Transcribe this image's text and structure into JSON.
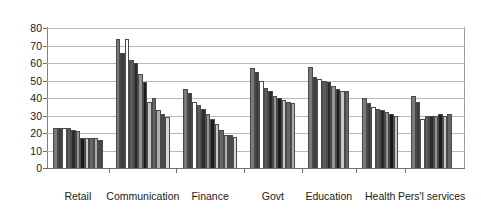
{
  "chart_data": {
    "type": "bar",
    "title": "",
    "subtitle": "",
    "xlabel": "",
    "ylabel": "",
    "ylim": [
      0,
      80
    ],
    "ytick_labels": [
      "80",
      "70",
      "60",
      "50",
      "40",
      "30",
      "20",
      "10",
      "0"
    ],
    "ytick_values": [
      80,
      70,
      60,
      50,
      40,
      30,
      20,
      10,
      0
    ],
    "grid": true,
    "legend": "none",
    "orientation": "vertical",
    "grouping": "clustered",
    "categories": [
      "Retail",
      "Communication",
      "Finance",
      "Govt",
      "Education",
      "Health",
      "Pers'l services"
    ],
    "groups": [
      {
        "category": "Retail",
        "values": [
          23,
          23,
          23,
          23,
          22,
          21,
          17,
          17,
          17,
          17,
          16
        ]
      },
      {
        "category": "Communication",
        "values": [
          74,
          66,
          74,
          62,
          60,
          54,
          49,
          38,
          40,
          33,
          31,
          29
        ]
      },
      {
        "category": "Finance",
        "values": [
          45,
          43,
          38,
          36,
          34,
          31,
          28,
          25,
          22,
          19,
          19,
          18
        ]
      },
      {
        "category": "Govt",
        "values": [
          57,
          55,
          50,
          46,
          44,
          41,
          40,
          39,
          38,
          37
        ]
      },
      {
        "category": "Education",
        "values": [
          58,
          52,
          51,
          50,
          49,
          47,
          45,
          44,
          44
        ]
      },
      {
        "category": "Health",
        "values": [
          40,
          37,
          35,
          34,
          33,
          32,
          31,
          30
        ]
      },
      {
        "category": "Pers'l services",
        "values": [
          41,
          38,
          28,
          30,
          30,
          30,
          31,
          30,
          31
        ]
      }
    ]
  }
}
